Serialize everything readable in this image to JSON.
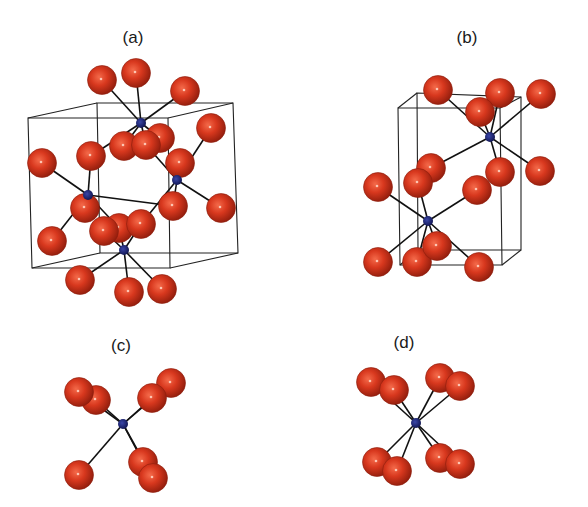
{
  "figure": {
    "colors": {
      "oxygen": "#d8381e",
      "oxygen_dark": "#8e1c0c",
      "metal": "#151a60",
      "bond": "#111111",
      "cell": "#222222",
      "background": "#ffffff"
    },
    "atom_radius": {
      "oxygen": 14.5,
      "metal": 5
    },
    "panels": [
      {
        "id": "a",
        "label": "(a)",
        "label_pos": [
          133,
          28
        ],
        "cell": {
          "front": [
            [
              28,
              118
            ],
            [
              168,
              118
            ],
            [
              170,
              268
            ],
            [
              32,
              268
            ]
          ],
          "back": [
            [
              97,
              103
            ],
            [
              233,
              103
            ],
            [
              238,
              253
            ],
            [
              100,
              253
            ]
          ]
        },
        "metals": [
          [
            141,
            123
          ],
          [
            88,
            195
          ],
          [
            177,
            180
          ],
          [
            124,
            250
          ]
        ],
        "oxygens": [
          [
            102,
            80
          ],
          [
            136,
            73
          ],
          [
            185,
            91
          ],
          [
            211,
            128
          ],
          [
            42,
            163
          ],
          [
            91,
            156
          ],
          [
            124,
            146
          ],
          [
            160,
            138
          ],
          [
            146,
            145
          ],
          [
            180,
            163
          ],
          [
            221,
            208
          ],
          [
            85,
            208
          ],
          [
            173,
            206
          ],
          [
            119,
            228
          ],
          [
            104,
            231
          ],
          [
            141,
            224
          ],
          [
            52,
            241
          ],
          [
            80,
            280
          ],
          [
            129,
            292
          ],
          [
            162,
            289
          ]
        ],
        "bonds": [
          [
            0,
            0
          ],
          [
            0,
            1
          ],
          [
            0,
            2
          ],
          [
            0,
            5
          ],
          [
            0,
            6
          ],
          [
            0,
            7
          ],
          [
            0,
            8
          ],
          [
            1,
            4
          ],
          [
            1,
            5
          ],
          [
            1,
            11
          ],
          [
            1,
            12
          ],
          [
            1,
            16
          ],
          [
            1,
            13
          ],
          [
            2,
            3
          ],
          [
            2,
            9
          ],
          [
            2,
            10
          ],
          [
            2,
            12
          ],
          [
            2,
            8
          ],
          [
            2,
            15
          ],
          [
            3,
            17
          ],
          [
            3,
            18
          ],
          [
            3,
            19
          ],
          [
            3,
            13
          ],
          [
            3,
            14
          ],
          [
            3,
            15
          ]
        ]
      },
      {
        "id": "b",
        "label": "(b)",
        "label_pos": [
          467,
          28
        ],
        "cell": {
          "front": [
            [
              398,
              108
            ],
            [
              500,
              108
            ],
            [
              502,
              265
            ],
            [
              400,
              265
            ]
          ],
          "back": [
            [
              417,
              93
            ],
            [
              521,
              97
            ],
            [
              521,
              250
            ],
            [
              418,
              250
            ]
          ]
        },
        "metals": [
          [
            490,
            137
          ],
          [
            428,
            221
          ]
        ],
        "oxygens": [
          [
            438,
            90
          ],
          [
            500,
            93
          ],
          [
            541,
            94
          ],
          [
            480,
            112
          ],
          [
            378,
            187
          ],
          [
            431,
            168
          ],
          [
            418,
            183
          ],
          [
            500,
            172
          ],
          [
            540,
            171
          ],
          [
            477,
            190
          ],
          [
            378,
            262
          ],
          [
            417,
            262
          ],
          [
            437,
            246
          ],
          [
            479,
            267
          ]
        ],
        "bonds": [
          [
            0,
            0
          ],
          [
            0,
            1
          ],
          [
            0,
            2
          ],
          [
            0,
            3
          ],
          [
            0,
            5
          ],
          [
            0,
            7
          ],
          [
            0,
            8
          ],
          [
            1,
            4
          ],
          [
            1,
            6
          ],
          [
            1,
            9
          ],
          [
            1,
            10
          ],
          [
            1,
            11
          ],
          [
            1,
            12
          ],
          [
            1,
            13
          ]
        ]
      },
      {
        "id": "c",
        "label": "(c)",
        "label_pos": [
          121,
          336
        ],
        "cell": null,
        "metals": [
          [
            123,
            424
          ]
        ],
        "oxygens": [
          [
            96,
            400
          ],
          [
            79,
            392
          ],
          [
            171,
            383
          ],
          [
            152,
            398
          ],
          [
            143,
            462
          ],
          [
            153,
            478
          ],
          [
            79,
            475
          ]
        ],
        "bonds": [
          [
            0,
            0
          ],
          [
            0,
            1
          ],
          [
            0,
            2
          ],
          [
            0,
            3
          ],
          [
            0,
            4
          ],
          [
            0,
            5
          ],
          [
            0,
            6
          ]
        ]
      },
      {
        "id": "d",
        "label": "(d)",
        "label_pos": [
          404,
          333
        ],
        "cell": null,
        "metals": [
          [
            416,
            423
          ]
        ],
        "oxygens": [
          [
            371,
            382
          ],
          [
            394,
            390
          ],
          [
            440,
            378
          ],
          [
            460,
            386
          ],
          [
            377,
            462
          ],
          [
            397,
            471
          ],
          [
            440,
            458
          ],
          [
            460,
            464
          ]
        ],
        "bonds": [
          [
            0,
            0
          ],
          [
            0,
            1
          ],
          [
            0,
            2
          ],
          [
            0,
            3
          ],
          [
            0,
            4
          ],
          [
            0,
            5
          ],
          [
            0,
            6
          ],
          [
            0,
            7
          ]
        ]
      }
    ]
  }
}
